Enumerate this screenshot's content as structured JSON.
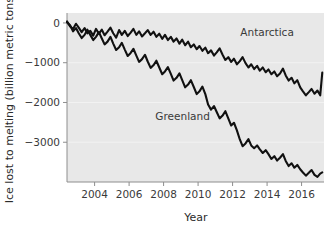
{
  "chart_data": {
    "type": "line",
    "title": "",
    "xlabel": "Year",
    "ylabel": "Ice lost to melting (billion metric tons)",
    "xlim": [
      2002.4,
      2017.3
    ],
    "ylim": [
      -4000,
      250
    ],
    "xticks": [
      2004,
      2006,
      2008,
      2010,
      2012,
      2014,
      2016
    ],
    "xticklabels": [
      "2004",
      "2006",
      "2008",
      "2010",
      "2012",
      "2014",
      "2016"
    ],
    "yticks": [
      0,
      -1000,
      -2000,
      -3000
    ],
    "yticklabels": [
      "0",
      "−1000",
      "−2000",
      "−3000"
    ],
    "grid": false,
    "legend_position": "inline-annotations",
    "annotations": [
      {
        "text": "Antarctica",
        "x": 2014.0,
        "y": -330
      },
      {
        "text": "Greenland",
        "x": 2009.1,
        "y": -2430
      }
    ],
    "series": [
      {
        "name": "Antarctica",
        "color": "#111111",
        "x": [
          2002.4,
          2002.58,
          2002.75,
          2002.92,
          2003.08,
          2003.25,
          2003.42,
          2003.58,
          2003.75,
          2003.92,
          2004.08,
          2004.25,
          2004.42,
          2004.58,
          2004.75,
          2004.92,
          2005.08,
          2005.25,
          2005.42,
          2005.58,
          2005.75,
          2005.92,
          2006.08,
          2006.25,
          2006.42,
          2006.58,
          2006.75,
          2006.92,
          2007.08,
          2007.25,
          2007.42,
          2007.58,
          2007.75,
          2007.92,
          2008.08,
          2008.25,
          2008.42,
          2008.58,
          2008.75,
          2008.92,
          2009.08,
          2009.25,
          2009.42,
          2009.58,
          2009.75,
          2009.92,
          2010.08,
          2010.25,
          2010.42,
          2010.58,
          2010.75,
          2010.92,
          2011.08,
          2011.25,
          2011.42,
          2011.58,
          2011.75,
          2011.92,
          2012.08,
          2012.25,
          2012.42,
          2012.58,
          2012.75,
          2012.92,
          2013.08,
          2013.25,
          2013.42,
          2013.58,
          2013.75,
          2013.92,
          2014.08,
          2014.25,
          2014.42,
          2014.58,
          2014.75,
          2014.92,
          2015.08,
          2015.25,
          2015.42,
          2015.58,
          2015.75,
          2015.92,
          2016.08,
          2016.25,
          2016.42,
          2016.58,
          2016.75,
          2016.92,
          2017.08,
          2017.2
        ],
        "y": [
          40,
          -90,
          -150,
          -20,
          -120,
          -230,
          -130,
          -260,
          -200,
          -320,
          -150,
          -270,
          -170,
          -310,
          -220,
          -120,
          -260,
          -370,
          -180,
          -300,
          -200,
          -330,
          -250,
          -150,
          -300,
          -210,
          -340,
          -260,
          -180,
          -300,
          -220,
          -350,
          -270,
          -400,
          -300,
          -430,
          -350,
          -470,
          -390,
          -520,
          -420,
          -560,
          -470,
          -610,
          -540,
          -660,
          -580,
          -700,
          -620,
          -760,
          -690,
          -820,
          -740,
          -640,
          -800,
          -930,
          -860,
          -980,
          -900,
          -1040,
          -960,
          -860,
          -1010,
          -1120,
          -1040,
          -1160,
          -1080,
          -1200,
          -1120,
          -1240,
          -1170,
          -1290,
          -1220,
          -1340,
          -1270,
          -1150,
          -1320,
          -1450,
          -1380,
          -1520,
          -1440,
          -1620,
          -1720,
          -1820,
          -1740,
          -1660,
          -1780,
          -1700,
          -1820,
          -1250
        ]
      },
      {
        "name": "Greenland",
        "color": "#111111",
        "x": [
          2002.4,
          2002.58,
          2002.75,
          2002.92,
          2003.08,
          2003.25,
          2003.42,
          2003.58,
          2003.75,
          2003.92,
          2004.08,
          2004.25,
          2004.42,
          2004.58,
          2004.75,
          2004.92,
          2005.08,
          2005.25,
          2005.42,
          2005.58,
          2005.75,
          2005.92,
          2006.08,
          2006.25,
          2006.42,
          2006.58,
          2006.75,
          2006.92,
          2007.08,
          2007.25,
          2007.42,
          2007.58,
          2007.75,
          2007.92,
          2008.08,
          2008.25,
          2008.42,
          2008.58,
          2008.75,
          2008.92,
          2009.08,
          2009.25,
          2009.42,
          2009.58,
          2009.75,
          2009.92,
          2010.08,
          2010.25,
          2010.42,
          2010.58,
          2010.75,
          2010.92,
          2011.08,
          2011.25,
          2011.42,
          2011.58,
          2011.75,
          2011.92,
          2012.08,
          2012.25,
          2012.42,
          2012.58,
          2012.75,
          2012.92,
          2013.08,
          2013.25,
          2013.42,
          2013.58,
          2013.75,
          2013.92,
          2014.08,
          2014.25,
          2014.42,
          2014.58,
          2014.75,
          2014.92,
          2015.08,
          2015.25,
          2015.42,
          2015.58,
          2015.75,
          2015.92,
          2016.08,
          2016.25,
          2016.42,
          2016.58,
          2016.75,
          2016.92,
          2017.08,
          2017.2
        ],
        "y": [
          20,
          -60,
          -210,
          -130,
          -260,
          -380,
          -300,
          -170,
          -300,
          -430,
          -350,
          -230,
          -390,
          -540,
          -470,
          -350,
          -520,
          -680,
          -610,
          -500,
          -670,
          -830,
          -760,
          -650,
          -820,
          -980,
          -910,
          -800,
          -970,
          -1130,
          -1060,
          -950,
          -1120,
          -1290,
          -1220,
          -1110,
          -1280,
          -1450,
          -1380,
          -1270,
          -1440,
          -1620,
          -1550,
          -1440,
          -1610,
          -1790,
          -1720,
          -1600,
          -1790,
          -2050,
          -2180,
          -2090,
          -2240,
          -2400,
          -2330,
          -2220,
          -2400,
          -2580,
          -2510,
          -2700,
          -2930,
          -3100,
          -3030,
          -2920,
          -3080,
          -3150,
          -3080,
          -3180,
          -3270,
          -3200,
          -3300,
          -3420,
          -3350,
          -3460,
          -3390,
          -3300,
          -3470,
          -3600,
          -3530,
          -3640,
          -3570,
          -3680,
          -3760,
          -3840,
          -3770,
          -3700,
          -3820,
          -3870,
          -3790,
          -3760
        ]
      }
    ]
  },
  "axis": {
    "x_title": "Year",
    "y_title": "Ice lost to melting (billion metric tons)"
  }
}
